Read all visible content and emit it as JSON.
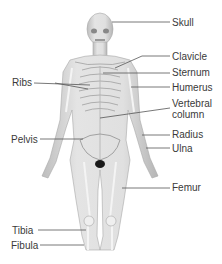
{
  "diagram": {
    "labels": [
      {
        "id": "skull",
        "text": "Skull",
        "x": 172,
        "y": 17
      },
      {
        "id": "clavicle",
        "text": "Clavicle",
        "x": 172,
        "y": 51
      },
      {
        "id": "sternum",
        "text": "Sternum",
        "x": 172,
        "y": 67
      },
      {
        "id": "humerus",
        "text": "Humerus",
        "x": 172,
        "y": 82
      },
      {
        "id": "vertebral",
        "text": "Vertebral",
        "x": 172,
        "y": 98
      },
      {
        "id": "column",
        "text": "column",
        "x": 172,
        "y": 109
      },
      {
        "id": "radius",
        "text": "Radius",
        "x": 172,
        "y": 129
      },
      {
        "id": "ulna",
        "text": "Ulna",
        "x": 172,
        "y": 143
      },
      {
        "id": "femur",
        "text": "Femur",
        "x": 172,
        "y": 182
      },
      {
        "id": "ribs",
        "text": "Ribs",
        "x": 12,
        "y": 77
      },
      {
        "id": "pelvis",
        "text": "Pelvis",
        "x": 11,
        "y": 134
      },
      {
        "id": "tibia",
        "text": "Tibia",
        "x": 12,
        "y": 225
      },
      {
        "id": "fibula",
        "text": "Fibula",
        "x": 11,
        "y": 240
      }
    ],
    "leader_color": "#555555",
    "figure_colors": {
      "skin": "#d9d9d9",
      "bone": "#f2f2f2",
      "shadow": "#9a9a9a",
      "dark": "#1a1a1a"
    }
  }
}
